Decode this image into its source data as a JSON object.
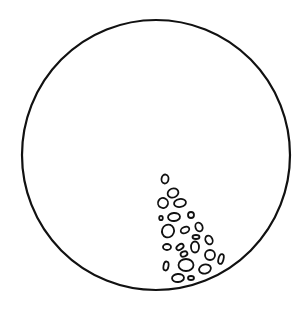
{
  "figure": {
    "description": "Circle outline containing a cluster of small pebble-like shapes in the lower-right interior",
    "stroke_color": "#111111",
    "background_color": "#ffffff",
    "circle": {
      "cx": 156,
      "cy": 155,
      "rx": 134,
      "ry": 135,
      "stroke_width": 2.2
    },
    "pebbles": [
      {
        "cx": 165,
        "cy": 179,
        "rx": 3.5,
        "ry": 4.5,
        "rot": 10
      },
      {
        "cx": 173,
        "cy": 193,
        "rx": 5.5,
        "ry": 4.5,
        "rot": -20
      },
      {
        "cx": 163,
        "cy": 203,
        "rx": 5,
        "ry": 5,
        "rot": 30
      },
      {
        "cx": 180,
        "cy": 203,
        "rx": 6,
        "ry": 4,
        "rot": -10
      },
      {
        "cx": 161,
        "cy": 218,
        "rx": 1.8,
        "ry": 2.2,
        "rot": 0
      },
      {
        "cx": 174,
        "cy": 217,
        "rx": 6,
        "ry": 4,
        "rot": -5
      },
      {
        "cx": 191,
        "cy": 215,
        "rx": 3,
        "ry": 3,
        "rot": 0
      },
      {
        "cx": 168,
        "cy": 231,
        "rx": 6,
        "ry": 6.5,
        "rot": 20
      },
      {
        "cx": 185,
        "cy": 230,
        "rx": 4.5,
        "ry": 3,
        "rot": -25
      },
      {
        "cx": 199,
        "cy": 227,
        "rx": 3.5,
        "ry": 4.5,
        "rot": -20
      },
      {
        "cx": 196,
        "cy": 237,
        "rx": 3.5,
        "ry": 2,
        "rot": 0
      },
      {
        "cx": 209,
        "cy": 240,
        "rx": 3.5,
        "ry": 4.5,
        "rot": -25
      },
      {
        "cx": 167,
        "cy": 247,
        "rx": 4,
        "ry": 3,
        "rot": 0
      },
      {
        "cx": 180,
        "cy": 247,
        "rx": 4,
        "ry": 2.5,
        "rot": -35
      },
      {
        "cx": 195,
        "cy": 247,
        "rx": 4,
        "ry": 5.5,
        "rot": 0
      },
      {
        "cx": 184,
        "cy": 254,
        "rx": 3.5,
        "ry": 2.5,
        "rot": -20
      },
      {
        "cx": 210,
        "cy": 255,
        "rx": 5,
        "ry": 5,
        "rot": 0
      },
      {
        "cx": 221,
        "cy": 259,
        "rx": 2.5,
        "ry": 5,
        "rot": 15
      },
      {
        "cx": 166,
        "cy": 266,
        "rx": 2.5,
        "ry": 4.5,
        "rot": 10
      },
      {
        "cx": 186,
        "cy": 265,
        "rx": 7.5,
        "ry": 6,
        "rot": 0
      },
      {
        "cx": 205,
        "cy": 269,
        "rx": 6,
        "ry": 4.5,
        "rot": -15
      },
      {
        "cx": 178,
        "cy": 278,
        "rx": 6,
        "ry": 4,
        "rot": -5
      },
      {
        "cx": 191,
        "cy": 278,
        "rx": 3,
        "ry": 2,
        "rot": 0
      }
    ]
  }
}
